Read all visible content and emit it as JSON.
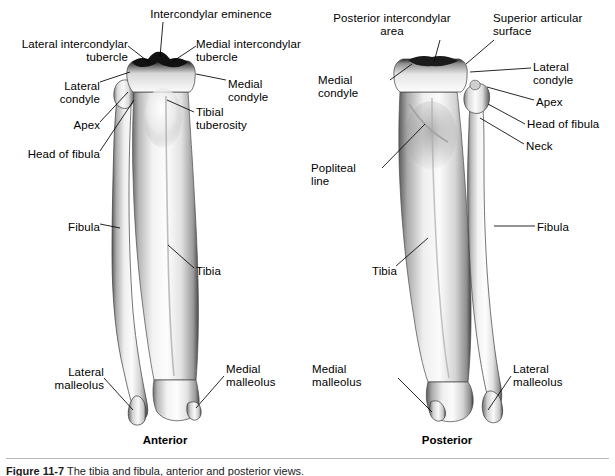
{
  "figure": {
    "title": "Tibia and fibula, anterior and posterior views",
    "caption_prefix": "Figure 11-7",
    "caption_text": "The tibia and fibula, anterior and posterior views.",
    "divider_color": "#b9b9b9",
    "background": "#ffffff",
    "ink_color": "#000000"
  },
  "views": [
    {
      "id": "anterior",
      "caption": "Anterior",
      "caption_x": 165,
      "caption_y": 434,
      "labels": [
        {
          "name": "intercondylar-eminence",
          "text": "Intercondylar eminence",
          "x": 126,
          "y": 8,
          "align": "c",
          "width": 170
        },
        {
          "name": "lateral-intercondylar-tubercle",
          "text": "Lateral intercondylar\ntubercle",
          "x": 6,
          "y": 38,
          "align": "r",
          "width": 122
        },
        {
          "name": "medial-intercondylar-tubercle",
          "text": "Medial intercondylar\ntubercle",
          "x": 196,
          "y": 38,
          "align": "l",
          "width": 120
        },
        {
          "name": "lateral-condyle",
          "text": "Lateral\ncondyle",
          "x": 10,
          "y": 80,
          "align": "r",
          "width": 90
        },
        {
          "name": "medial-condyle",
          "text": "Medial\ncondyle",
          "x": 228,
          "y": 78,
          "align": "l",
          "width": 80
        },
        {
          "name": "apex",
          "text": "Apex",
          "x": 10,
          "y": 119,
          "align": "r",
          "width": 90
        },
        {
          "name": "tibial-tuberosity",
          "text": "Tibial\ntuberosity",
          "x": 196,
          "y": 106,
          "align": "l",
          "width": 90
        },
        {
          "name": "head-of-fibula",
          "text": "Head of fibula",
          "x": 6,
          "y": 148,
          "align": "r",
          "width": 94
        },
        {
          "name": "fibula",
          "text": "Fibula",
          "x": 24,
          "y": 221,
          "align": "r",
          "width": 76
        },
        {
          "name": "tibia",
          "text": "Tibia",
          "x": 196,
          "y": 265,
          "align": "l",
          "width": 60
        },
        {
          "name": "lateral-malleolus",
          "text": "Lateral\nmalleolus",
          "x": 10,
          "y": 366,
          "align": "r",
          "width": 94
        },
        {
          "name": "medial-malleolus",
          "text": "Medial\nmalleolus",
          "x": 226,
          "y": 363,
          "align": "l",
          "width": 86
        }
      ]
    },
    {
      "id": "posterior",
      "caption": "Posterior",
      "caption_x": 447,
      "caption_y": 434,
      "labels": [
        {
          "name": "posterior-intercondylar-area",
          "text": "Posterior intercondylar\narea",
          "x": 316,
          "y": 12,
          "align": "c",
          "width": 152
        },
        {
          "name": "superior-articular-surface",
          "text": "Superior articular\nsurface",
          "x": 493,
          "y": 12,
          "align": "l",
          "width": 114
        },
        {
          "name": "medial-condyle",
          "text": "Medial\ncondyle",
          "x": 318,
          "y": 74,
          "align": "l",
          "width": 74
        },
        {
          "name": "lateral-condyle",
          "text": "Lateral\ncondyle",
          "x": 533,
          "y": 61,
          "align": "l",
          "width": 74
        },
        {
          "name": "apex",
          "text": "Apex",
          "x": 536,
          "y": 96,
          "align": "l",
          "width": 60
        },
        {
          "name": "head-of-fibula",
          "text": "Head of fibula",
          "x": 527,
          "y": 118,
          "align": "l",
          "width": 88
        },
        {
          "name": "neck",
          "text": "Neck",
          "x": 526,
          "y": 140,
          "align": "l",
          "width": 60
        },
        {
          "name": "popliteal-line",
          "text": "Popliteal\nline",
          "x": 311,
          "y": 162,
          "align": "l",
          "width": 70
        },
        {
          "name": "fibula",
          "text": "Fibula",
          "x": 537,
          "y": 221,
          "align": "l",
          "width": 62
        },
        {
          "name": "tibia",
          "text": "Tibia",
          "x": 372,
          "y": 265,
          "align": "l",
          "width": 60
        },
        {
          "name": "medial-malleolus",
          "text": "Medial\nmalleolus",
          "x": 312,
          "y": 363,
          "align": "l",
          "width": 86
        },
        {
          "name": "lateral-malleolus",
          "text": "Lateral\nmalleolus",
          "x": 513,
          "y": 363,
          "align": "l",
          "width": 90
        }
      ]
    }
  ]
}
